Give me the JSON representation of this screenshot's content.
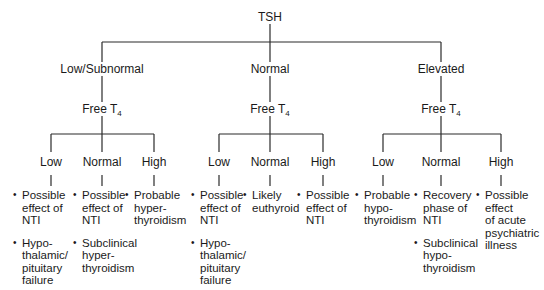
{
  "root": {
    "label": "TSH"
  },
  "branches": [
    {
      "label": "Low/Subnormal",
      "sub_label": "Free T",
      "sub_label_subscript": "4",
      "children": [
        {
          "label": "Low",
          "items": [
            [
              "Possible",
              "effect of",
              "NTI"
            ],
            [
              "Hypo-",
              "thalamic/",
              "pituitary",
              "failure"
            ]
          ]
        },
        {
          "label": "Normal",
          "items": [
            [
              "Possible",
              "effect of",
              "NTI"
            ],
            [
              "Subclinical",
              "hyper-",
              "thyroidism"
            ]
          ]
        },
        {
          "label": "High",
          "items": [
            [
              "Probable",
              "hyper-",
              "thyroidism"
            ]
          ]
        }
      ]
    },
    {
      "label": "Normal",
      "sub_label": "Free T",
      "sub_label_subscript": "4",
      "children": [
        {
          "label": "Low",
          "items": [
            [
              "Possible",
              "effect of",
              "NTI"
            ],
            [
              "Hypo-",
              "thalamic/",
              "pituitary",
              "failure"
            ]
          ]
        },
        {
          "label": "Normal",
          "items": [
            [
              "Likely",
              "euthyroid"
            ]
          ]
        },
        {
          "label": "High",
          "items": [
            [
              "Possible",
              "effect of",
              "NTI"
            ]
          ]
        }
      ]
    },
    {
      "label": "Elevated",
      "sub_label": "Free T",
      "sub_label_subscript": "4",
      "children": [
        {
          "label": "Low",
          "items": [
            [
              "Probable",
              "hypo-",
              "thyroidism"
            ]
          ]
        },
        {
          "label": "Normal",
          "items": [
            [
              "Recovery",
              "phase of",
              "NTI"
            ],
            [
              "Subclinical",
              "hypo-",
              "thyroidism"
            ]
          ]
        },
        {
          "label": "High",
          "items": [
            [
              "Possible",
              "effect",
              "of acute",
              "psychiatric",
              "illness"
            ]
          ]
        }
      ]
    }
  ]
}
